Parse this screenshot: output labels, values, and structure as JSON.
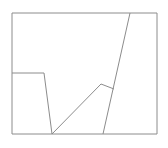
{
  "figure": {
    "background_color": "#ffffff",
    "canvas": {
      "width": 168,
      "height": 148
    },
    "stroke_color": "#8c8c8c",
    "stroke_width": 1,
    "frame": {
      "name": "outer-rectangle",
      "x": 12,
      "y": 13,
      "width": 145,
      "height": 121,
      "points": "12,13 157,13 157,134 12,134 12,13"
    },
    "shapes": [
      {
        "name": "left-trapezoid",
        "description": "open quadrilateral attached to the left frame edge",
        "points": "12,73 44,73 52,134"
      },
      {
        "name": "rising-diagonal",
        "description": "long diagonal from bottom vertex up to the small peak",
        "points": "52,134 101,84"
      },
      {
        "name": "peak-descent",
        "description": "short segment descending right from the peak",
        "points": "101,84 114,89"
      },
      {
        "name": "steep-diagonal",
        "description": "steep line from bottom border up through the peak junction to the top border",
        "points": "103,134 130,13"
      }
    ]
  }
}
